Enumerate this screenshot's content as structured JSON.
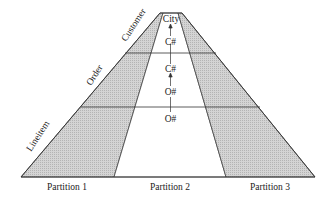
{
  "diagram": {
    "tables": [
      "Customer",
      "Order",
      "Lineitem"
    ],
    "partitions": [
      "Partition 1",
      "Partition 2",
      "Partition 3"
    ],
    "path_nodes": [
      "City",
      "C#",
      "C#",
      "O#",
      "O#"
    ],
    "colors": {
      "shaded": "#c8c8c8",
      "line": "#333333",
      "background": "#ffffff"
    }
  }
}
